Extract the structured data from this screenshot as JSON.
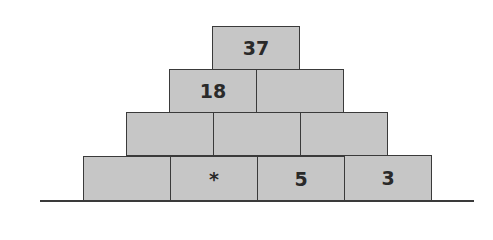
{
  "pyramid": {
    "rows": [
      {
        "cells": [
          "37"
        ]
      },
      {
        "cells": [
          "18",
          ""
        ]
      },
      {
        "cells": [
          "",
          "",
          ""
        ]
      },
      {
        "cells": [
          "",
          "*",
          "5",
          "3"
        ]
      }
    ]
  },
  "colors": {
    "brick_fill": "#c6c6c6",
    "brick_border": "#3a3a3a",
    "text": "#2a2a2a"
  }
}
